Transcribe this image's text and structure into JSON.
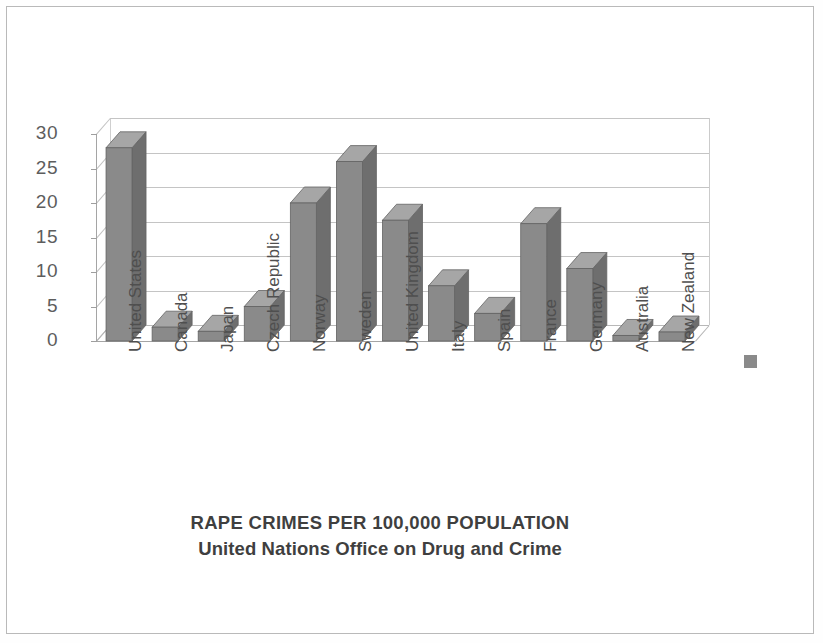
{
  "chart_data": {
    "type": "bar",
    "title": "RAPE CRIMES PER 100,000 POPULATION",
    "subtitle": "United Nations Office on Drug and Crime",
    "xlabel": "",
    "ylabel": "",
    "ylim": [
      0,
      30
    ],
    "yticks": [
      0,
      5,
      10,
      15,
      20,
      25,
      30
    ],
    "ytick_labels": [
      "0",
      "5",
      "10",
      "15",
      "20",
      "25",
      "30"
    ],
    "grid": true,
    "grid_axis": "y",
    "legend": {
      "visible": true,
      "position": "right",
      "entries": [
        {
          "label": "",
          "color": "#8a8a8a"
        }
      ]
    },
    "bar_color": "#858585",
    "style": "3d-column",
    "categories": [
      "United States",
      "Canada",
      "Japan",
      "Czech Republic",
      "Norway",
      "Sweden",
      "United Kingdom",
      "Italy",
      "Spain",
      "France",
      "Germany",
      "Australia",
      "New Zealand"
    ],
    "values": [
      28.0,
      2.0,
      1.4,
      5.0,
      20.0,
      26.0,
      17.5,
      8.0,
      4.0,
      17.0,
      10.5,
      0.8,
      1.3
    ],
    "series": [
      {
        "name": "",
        "values": [
          28.0,
          2.0,
          1.4,
          5.0,
          20.0,
          26.0,
          17.5,
          8.0,
          4.0,
          17.0,
          10.5,
          0.8,
          1.3
        ]
      }
    ]
  },
  "figure": {
    "background": "#ffffff",
    "border_color": "#b9b9b9",
    "axis_color": "#a5a5a5",
    "gridline_color": "#c4c4c4",
    "tick_label_color": "#5d5d5d",
    "title_color": "#3f3f3f"
  }
}
